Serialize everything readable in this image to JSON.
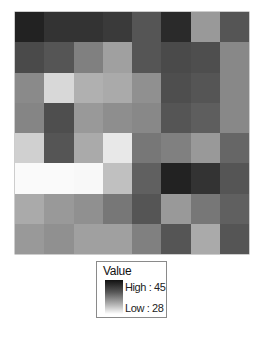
{
  "chart_data": {
    "type": "heatmap",
    "title": "",
    "xlabel": "",
    "ylabel": "",
    "rows": 8,
    "cols": 8,
    "value_range": [
      28,
      45
    ],
    "colormap": "grayscale (white = low 28, black = high 45)",
    "values": [
      [
        44,
        42,
        42,
        41,
        39,
        43,
        34,
        39
      ],
      [
        40,
        39,
        36,
        34,
        39,
        40,
        40,
        35
      ],
      [
        36,
        30,
        33,
        33,
        36,
        40,
        39,
        35
      ],
      [
        36,
        40,
        34,
        35,
        36,
        39,
        38,
        35
      ],
      [
        30,
        39,
        33,
        29,
        37,
        36,
        34,
        38
      ],
      [
        28,
        28,
        28,
        31,
        38,
        44,
        42,
        39
      ],
      [
        33,
        34,
        35,
        37,
        39,
        34,
        37,
        38
      ],
      [
        34,
        35,
        34,
        34,
        36,
        39,
        33,
        39
      ]
    ],
    "cell_colors": [
      [
        "#222222",
        "#333333",
        "#333333",
        "#3a3a3a",
        "#555555",
        "#2a2a2a",
        "#999999",
        "#555555"
      ],
      [
        "#4a4a4a",
        "#555555",
        "#808080",
        "#a0a0a0",
        "#555555",
        "#4a4a4a",
        "#4e4e4e",
        "#888888"
      ],
      [
        "#8a8a8a",
        "#d8d8d8",
        "#b0b0b0",
        "#aaaaaa",
        "#909090",
        "#4e4e4e",
        "#555555",
        "#888888"
      ],
      [
        "#858585",
        "#4e4e4e",
        "#999999",
        "#8e8e8e",
        "#888888",
        "#555555",
        "#5e5e5e",
        "#888888"
      ],
      [
        "#d0d0d0",
        "#555555",
        "#aaaaaa",
        "#e8e8e8",
        "#777777",
        "#808080",
        "#999999",
        "#666666"
      ],
      [
        "#fafafa",
        "#fafafa",
        "#f8f8f8",
        "#c0c0c0",
        "#606060",
        "#222222",
        "#333333",
        "#555555"
      ],
      [
        "#aaaaaa",
        "#999999",
        "#909090",
        "#777777",
        "#555555",
        "#999999",
        "#777777",
        "#606060"
      ],
      [
        "#999999",
        "#909090",
        "#a0a0a0",
        "#a0a0a0",
        "#808080",
        "#555555",
        "#aaaaaa",
        "#555555"
      ]
    ],
    "legend": {
      "title": "Value",
      "high_label": "High : 45",
      "low_label": "Low : 28",
      "high_color": "#111111",
      "low_color": "#ffffff",
      "position": "bottom-center"
    },
    "grid": false
  }
}
